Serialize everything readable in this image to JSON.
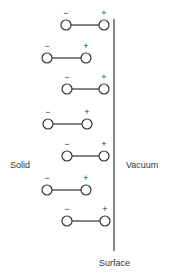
{
  "diagram": {
    "labels": {
      "solid": "Solid",
      "vacuum": "Vacuum",
      "surface": "Surface"
    },
    "surface_line": {
      "x": 114,
      "y1": 19,
      "y2": 251
    },
    "dipole_signs": {
      "negative": "−",
      "positive": "+"
    },
    "dipoles": [
      {
        "x1": 66,
        "x2": 104,
        "y": 25
      },
      {
        "x1": 47,
        "x2": 86,
        "y": 58
      },
      {
        "x1": 67,
        "x2": 104,
        "y": 89
      },
      {
        "x1": 48,
        "x2": 87,
        "y": 124
      },
      {
        "x1": 67,
        "x2": 104,
        "y": 156
      },
      {
        "x1": 47,
        "x2": 86,
        "y": 190
      },
      {
        "x1": 67,
        "x2": 105,
        "y": 221
      }
    ],
    "colors": {
      "stroke": "#333333",
      "background": "#ffffff"
    }
  }
}
